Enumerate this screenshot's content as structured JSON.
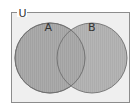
{
  "diagram": {
    "type": "venn",
    "universe": {
      "label": "U"
    },
    "sets": [
      {
        "label": "A"
      },
      {
        "label": "B"
      }
    ],
    "colors": {
      "background": "#ffffff",
      "universe_fill": "#efefef",
      "universe_stroke": "#8c8c8c",
      "circle_fill": "#a9a9a9",
      "circle_stroke": "#6f6f6f"
    }
  }
}
